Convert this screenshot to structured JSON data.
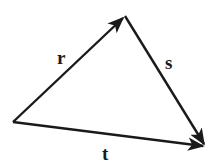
{
  "diagram": {
    "type": "vector-triangle",
    "stroke_color": "#1a1a1a",
    "background": "#ffffff",
    "vertices": {
      "left": [
        13,
        122
      ],
      "top": [
        125,
        16
      ],
      "bottom_right": [
        206,
        146
      ]
    },
    "vectors": [
      {
        "name": "r",
        "label": "r",
        "from": "left",
        "to": "top",
        "label_pos": [
          62,
          63
        ]
      },
      {
        "name": "s",
        "label": "s",
        "from": "top",
        "to": "bottom_right",
        "label_pos": [
          170,
          69
        ]
      },
      {
        "name": "t",
        "label": "t",
        "from": "left",
        "to": "bottom_right",
        "label_pos": [
          107,
          159
        ]
      }
    ]
  }
}
